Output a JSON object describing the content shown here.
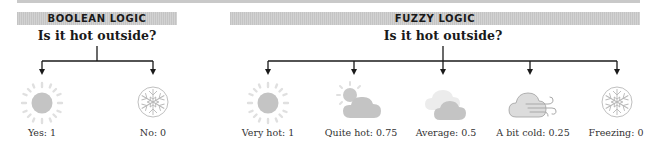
{
  "boolean": {
    "header": "BOOLEAN LOGIC",
    "question": "Is it hot outside?",
    "options": [
      {
        "icon": "sun-icon",
        "label": "Yes: 1"
      },
      {
        "icon": "snowflake-icon",
        "label": "No: 0"
      }
    ]
  },
  "fuzzy": {
    "header": "FUZZY LOGIC",
    "question": "Is it hot outside?",
    "options": [
      {
        "icon": "sun-icon",
        "label": "Very hot: 1"
      },
      {
        "icon": "sun-behind-cloud-icon",
        "label": "Quite hot: 0.75"
      },
      {
        "icon": "cloudy-icon",
        "label": "Average: 0.5"
      },
      {
        "icon": "windy-cloud-icon",
        "label": "A bit cold: 0.25"
      },
      {
        "icon": "snowflake-icon",
        "label": "Freezing: 0"
      }
    ]
  },
  "colors": {
    "header_bg": "#c8c8c8",
    "icon_fill": "#c4c4c4",
    "icon_light": "#e2e2e2",
    "line": "#1a1a1a"
  }
}
